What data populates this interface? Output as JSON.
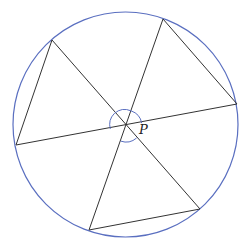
{
  "diagram": {
    "type": "geometry",
    "circle": {
      "cx": 125.5,
      "cy": 124.5,
      "r": 112.5,
      "stroke": "#5a6fc0"
    },
    "points": {
      "A": {
        "x": 52,
        "y": 40
      },
      "B": {
        "x": 163,
        "y": 19
      },
      "C": {
        "x": 237,
        "y": 104
      },
      "D": {
        "x": 200,
        "y": 209
      },
      "E": {
        "x": 89,
        "y": 230
      },
      "F": {
        "x": 16,
        "y": 145
      },
      "P": {
        "x": 126,
        "y": 126
      }
    },
    "labels": {
      "P": {
        "text": "P",
        "x": 139,
        "y": 134
      }
    },
    "line_color": "#333333",
    "arc_color": "#5a6fc0"
  }
}
